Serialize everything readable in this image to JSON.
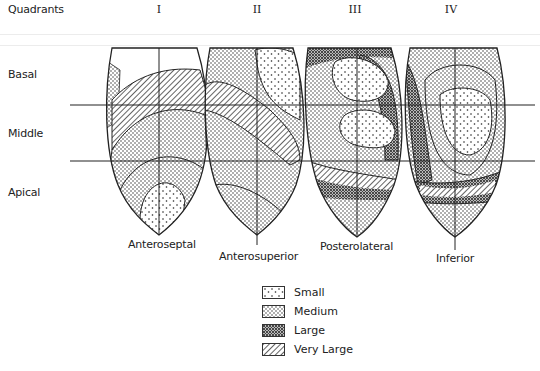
{
  "header": {
    "quadrants_label": "Quadrants",
    "quadrants": [
      "I",
      "II",
      "III",
      "IV"
    ]
  },
  "levels": [
    "Basal",
    "Middle",
    "Apical"
  ],
  "segments": [
    "Anteroseptal",
    "Anterosuperior",
    "Posterolateral",
    "Inferior"
  ],
  "legend": {
    "items": [
      {
        "label": "Small",
        "pattern": "sparse-dots"
      },
      {
        "label": "Medium",
        "pattern": "medium-dots"
      },
      {
        "label": "Large",
        "pattern": "dense-dots"
      },
      {
        "label": "Very Large",
        "pattern": "diagonal-hatch"
      }
    ]
  },
  "colors": {
    "ink": "#222222",
    "background": "#ffffff"
  }
}
